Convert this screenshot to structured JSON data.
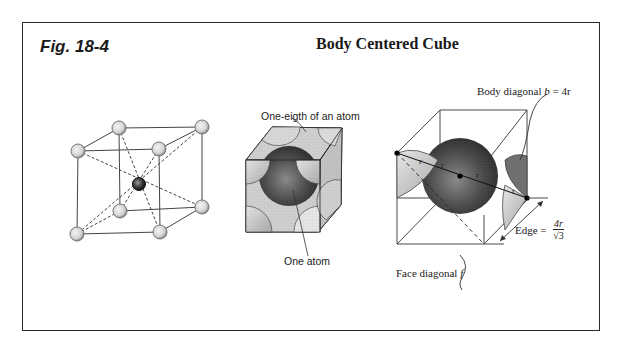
{
  "figure": {
    "label": "Fig. 18-4",
    "title": "Body Centered Cube"
  },
  "panels": {
    "lattice": {
      "description": "Ball-and-stick BCC unit cell: 8 corner atoms and 1 center atom with dashed body diagonals"
    },
    "space_filling": {
      "corner_label": "One-eigth of an atom",
      "center_label": "One atom"
    },
    "geometry": {
      "body_diagonal_label": "Body diagonal",
      "body_diagonal_var": "b",
      "body_diagonal_value": "= 4r",
      "edge_label": "Edge =",
      "edge_numerator": "4r",
      "edge_denominator": "√3",
      "face_diagonal_label": "Face diagonal",
      "face_diagonal_var": "f",
      "radius_marks": [
        "r",
        "r",
        "r",
        "r"
      ]
    }
  },
  "colors": {
    "frame": "#2a2a2a",
    "line": "#333333",
    "corner_atom": "#d9d9d9",
    "center_atom": "#3a3a3a",
    "big_sphere": "#4a4a4a",
    "partial_atom": "#c8c8c8"
  }
}
